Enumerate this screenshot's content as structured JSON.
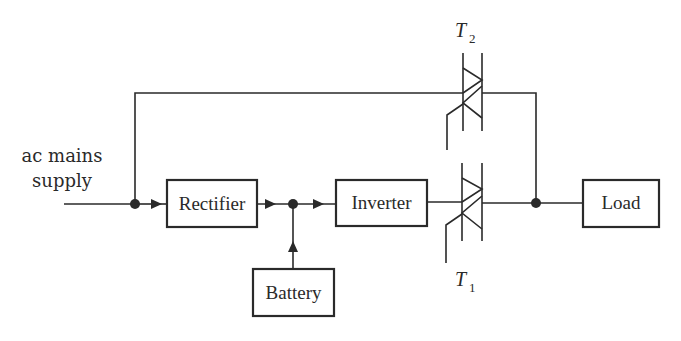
{
  "diagram": {
    "type": "block-diagram",
    "input": {
      "label_line1": "ac mains",
      "label_line2": "supply"
    },
    "blocks": {
      "rectifier": "Rectifier",
      "inverter": "Inverter",
      "battery": "Battery",
      "load": "Load"
    },
    "switches": {
      "t1": {
        "symbol": "T",
        "subscript": "1",
        "type": "triac"
      },
      "t2": {
        "symbol": "T",
        "subscript": "2",
        "type": "triac"
      }
    },
    "connections": [
      "ac mains supply -> junction A",
      "junction A -> Rectifier",
      "junction A -> bypass line -> T2",
      "Rectifier -> junction B",
      "Battery -> junction B",
      "junction B -> Inverter",
      "Inverter -> T1",
      "T1 -> junction C",
      "T2 -> junction C",
      "junction C -> Load"
    ],
    "colors": {
      "line": "#2a2a2a",
      "background": "#ffffff"
    }
  }
}
